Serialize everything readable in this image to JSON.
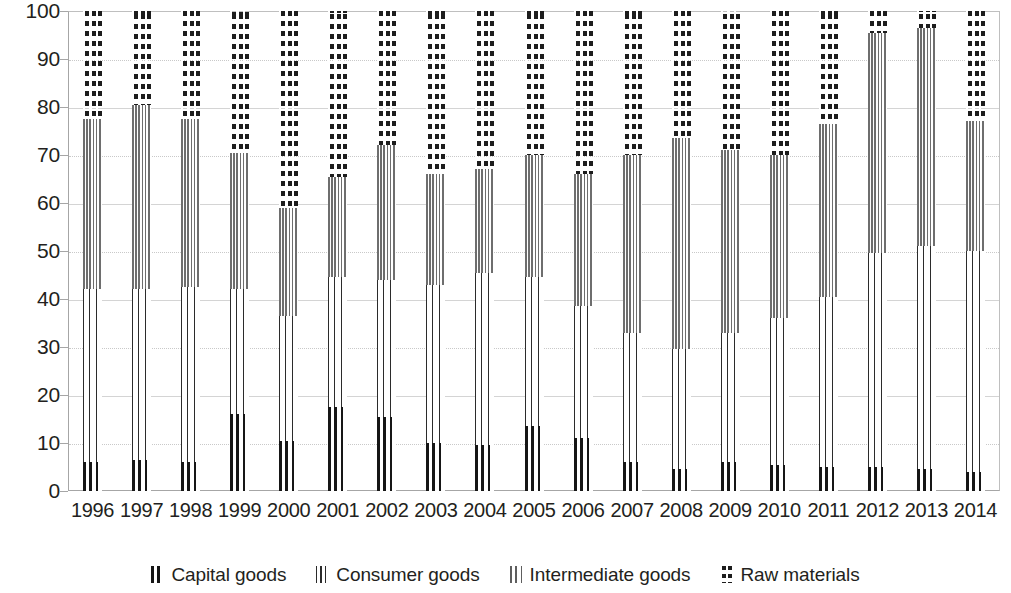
{
  "chart_data": {
    "type": "bar",
    "stacked": true,
    "title": "",
    "subtitle": "",
    "xlabel": "",
    "ylabel": "",
    "ylim": [
      0,
      100
    ],
    "yticks": [
      0,
      10,
      20,
      30,
      40,
      50,
      60,
      70,
      80,
      90,
      100
    ],
    "ytick_labels": [
      "0",
      "10",
      "20",
      "30",
      "40",
      "50",
      "60",
      "70",
      "80",
      "90",
      "100"
    ],
    "grid": true,
    "grid_axis": "y",
    "legend_position": "bottom",
    "categories": [
      "1996",
      "1997",
      "1998",
      "1999",
      "2000",
      "2001",
      "2002",
      "2003",
      "2004",
      "2005",
      "2006",
      "2007",
      "2008",
      "2009",
      "2010",
      "2011",
      "2012",
      "2013",
      "2014"
    ],
    "series": [
      {
        "name": "Capital goods",
        "pattern": "thick-vertical-lines",
        "color": "#161616",
        "values": [
          6.0,
          6.5,
          6.0,
          16.0,
          10.5,
          17.5,
          15.5,
          10.0,
          9.5,
          13.5,
          11.0,
          6.0,
          4.5,
          6.0,
          5.5,
          5.0,
          5.0,
          4.5,
          4.0
        ]
      },
      {
        "name": "Consumer goods",
        "pattern": "fine-vertical-lines",
        "color": "#2b2b2b",
        "values": [
          36.0,
          35.5,
          36.5,
          26.0,
          26.0,
          27.0,
          28.5,
          33.0,
          36.0,
          31.0,
          27.5,
          27.0,
          25.0,
          27.0,
          30.5,
          35.5,
          44.5,
          46.5,
          46.0
        ]
      },
      {
        "name": "Intermediate goods",
        "pattern": "medium-vertical-lines",
        "color": "#6e6e6e",
        "values": [
          35.5,
          38.5,
          35.0,
          28.5,
          22.5,
          21.0,
          28.0,
          23.0,
          21.5,
          25.5,
          27.5,
          37.0,
          44.0,
          38.0,
          34.0,
          36.0,
          46.0,
          45.5,
          27.0
        ]
      },
      {
        "name": "Raw materials",
        "pattern": "dashed-vertical-lines",
        "color": "#1d1d1d",
        "values": [
          22.5,
          19.5,
          22.5,
          29.5,
          41.0,
          34.5,
          28.0,
          34.0,
          33.0,
          30.0,
          34.0,
          30.0,
          26.5,
          29.0,
          30.0,
          23.5,
          4.5,
          3.5,
          23.0
        ]
      }
    ],
    "cumulative_tops": {
      "capital": [
        6.0,
        6.5,
        6.0,
        16.0,
        10.5,
        17.5,
        15.5,
        10.0,
        9.5,
        13.5,
        11.0,
        6.0,
        4.5,
        6.0,
        5.5,
        5.0,
        5.0,
        4.5,
        4.0
      ],
      "consumer": [
        42.0,
        42.0,
        42.5,
        42.0,
        36.5,
        44.5,
        44.0,
        43.0,
        45.5,
        44.5,
        38.5,
        33.0,
        29.5,
        33.0,
        36.0,
        40.5,
        49.5,
        51.0,
        50.0
      ],
      "intermediate": [
        77.5,
        80.5,
        77.5,
        70.5,
        59.0,
        65.5,
        72.0,
        66.0,
        67.0,
        70.0,
        66.0,
        70.0,
        73.5,
        71.0,
        70.0,
        76.5,
        95.5,
        96.5,
        77.0
      ],
      "raw": [
        100,
        100,
        100,
        100,
        100,
        100,
        100,
        100,
        100,
        100,
        100,
        100,
        100,
        100,
        100,
        100,
        100,
        100,
        100
      ]
    }
  },
  "legend": {
    "items": [
      {
        "label": "Capital goods",
        "key": "capital"
      },
      {
        "label": "Consumer goods",
        "key": "consumer"
      },
      {
        "label": "Intermediate goods",
        "key": "intermediate"
      },
      {
        "label": "Raw materials",
        "key": "raw"
      }
    ]
  },
  "colors": {
    "axis": "#a6a6a6",
    "grid": "#c9c9c9",
    "text": "#231f20",
    "background": "#ffffff"
  }
}
